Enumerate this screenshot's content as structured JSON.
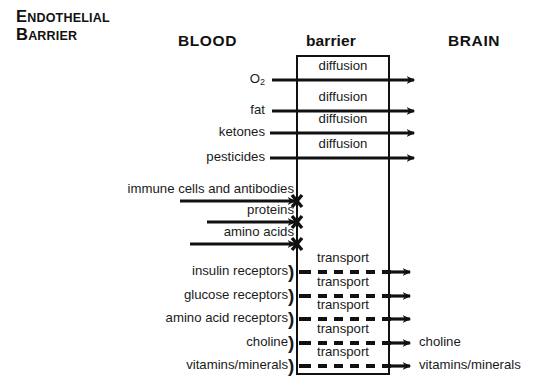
{
  "title": {
    "line1_cap": "E",
    "line1_rest": "NDOTHELIAL",
    "line2_cap": "B",
    "line2_rest": "ARRIER"
  },
  "columns": {
    "left": "BLOOD",
    "middle": "barrier",
    "right": "BRAIN"
  },
  "colors": {
    "ink": "#1a1a1a",
    "line": "#111111",
    "background": "#ffffff"
  },
  "mechanisms": {
    "diffusion": "diffusion",
    "transport": "transport",
    "blocked": "X"
  },
  "rows": [
    {
      "label": "O2",
      "label_base": "O",
      "label_sub": "2",
      "mechanism": "diffusion",
      "crosses": true,
      "out_label": "",
      "y": 80
    },
    {
      "label": "fat",
      "mechanism": "diffusion",
      "crosses": true,
      "out_label": "",
      "y": 111
    },
    {
      "label": "ketones",
      "mechanism": "diffusion",
      "crosses": true,
      "out_label": "",
      "y": 133
    },
    {
      "label": "pesticides",
      "mechanism": "diffusion",
      "crosses": true,
      "out_label": "",
      "y": 158
    },
    {
      "label": "immune cells and antibodies",
      "mechanism": "blocked",
      "crosses": false,
      "out_label": "",
      "y": 201
    },
    {
      "label": "proteins",
      "mechanism": "blocked",
      "crosses": false,
      "out_label": "",
      "y": 222
    },
    {
      "label": "amino acids",
      "mechanism": "blocked",
      "crosses": false,
      "out_label": "",
      "y": 244
    },
    {
      "label": "insulin receptors",
      "mechanism": "transport",
      "crosses": true,
      "out_label": "",
      "y": 272,
      "receptor": true
    },
    {
      "label": "glucose receptors",
      "mechanism": "transport",
      "crosses": true,
      "out_label": "",
      "y": 296,
      "receptor": true
    },
    {
      "label": "amino acid receptors",
      "mechanism": "transport",
      "crosses": true,
      "out_label": "",
      "y": 319,
      "receptor": true
    },
    {
      "label": "choline",
      "mechanism": "transport",
      "crosses": true,
      "out_label": "choline",
      "y": 343,
      "receptor": true
    },
    {
      "label": "vitamins/minerals",
      "mechanism": "transport",
      "crosses": true,
      "out_label": "vitamins/minerals",
      "y": 366,
      "receptor": true
    }
  ],
  "geometry": {
    "barrier_left": 297,
    "barrier_right": 389,
    "barrier_top": 56,
    "barrier_bottom": 374
  }
}
